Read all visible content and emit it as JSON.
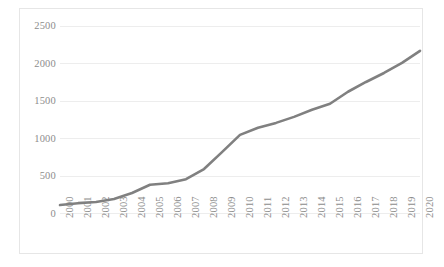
{
  "chart_data": {
    "type": "line",
    "title": "",
    "subtitle": "",
    "xlabel": "",
    "ylabel": "",
    "categories": [
      "2000",
      "2001",
      "2002",
      "2003",
      "2004",
      "2005",
      "2006",
      "2007",
      "2008",
      "2009",
      "2010",
      "2011",
      "2012",
      "2013",
      "2014",
      "2015",
      "2016",
      "2017",
      "2018",
      "2019",
      "2020"
    ],
    "x": [
      2000,
      2001,
      2002,
      2003,
      2004,
      2005,
      2006,
      2007,
      2008,
      2009,
      2010,
      2011,
      2012,
      2013,
      2014,
      2015,
      2016,
      2017,
      2018,
      2019,
      2020
    ],
    "values": [
      110,
      135,
      150,
      190,
      270,
      380,
      400,
      455,
      590,
      815,
      1045,
      1140,
      1205,
      1285,
      1380,
      1460,
      1620,
      1750,
      1870,
      2005,
      2165
    ],
    "series": [
      {
        "name": "series-1",
        "color": "#808080",
        "values": [
          110,
          135,
          150,
          190,
          270,
          380,
          400,
          455,
          590,
          815,
          1045,
          1140,
          1205,
          1285,
          1380,
          1460,
          1620,
          1750,
          1870,
          2005,
          2165
        ]
      }
    ],
    "ylim": [
      0,
      2500
    ],
    "xlim": [
      2000,
      2020
    ],
    "y_ticks": [
      0,
      500,
      1000,
      1500,
      2000,
      2500
    ],
    "y_tick_labels": [
      "0",
      "500",
      "1000",
      "1500",
      "2000",
      "2500"
    ],
    "x_tick_labels": [
      "2000",
      "2001",
      "2002",
      "2003",
      "2004",
      "2005",
      "2006",
      "2007",
      "2008",
      "2009",
      "2010",
      "2011",
      "2012",
      "2013",
      "2014",
      "2015",
      "2016",
      "2017",
      "2018",
      "2019",
      "2020"
    ],
    "grid": true,
    "grid_axis": "y",
    "legend": false,
    "legend_position": "none",
    "annotations": [],
    "colors": {
      "line": "#808080",
      "gridline": "#ededed",
      "tick_text": "#8d8d8d",
      "frame": "#e6e6e6",
      "background": "#ffffff"
    },
    "line_width": 2.6
  }
}
